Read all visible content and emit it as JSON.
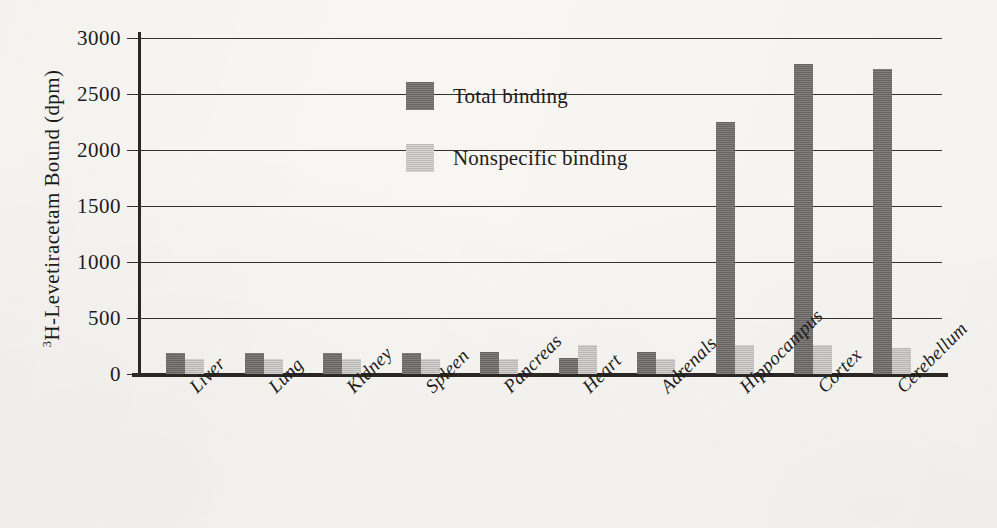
{
  "chart_data": {
    "type": "bar",
    "title": "",
    "xlabel": "",
    "ylabel": "3H-Levetiracetam Bound (dpm)",
    "ylabel_prefix_superscript": "3",
    "ylabel_rest": "H-Levetiracetam Bound (dpm)",
    "ylim": [
      0,
      3000
    ],
    "ytick_values": [
      3000,
      2500,
      2000,
      1500,
      1000,
      500,
      0
    ],
    "ytick_labels": [
      "3000",
      "2500",
      "2000",
      "1500",
      "1000",
      "500",
      "0"
    ],
    "grid": true,
    "grid_axis": "y",
    "legend_position": "upper-left-inside",
    "categories": [
      "Liver",
      "Lung",
      "Kidney",
      "Spleen",
      "Pancreas",
      "Heart",
      "Adrenals",
      "Hippocampus",
      "Cortex",
      "Cerebellum"
    ],
    "series": [
      {
        "name": "Total binding",
        "color": "#72706e",
        "values": [
          190,
          190,
          190,
          190,
          195,
          140,
          195,
          2250,
          2770,
          2720
        ]
      },
      {
        "name": "Nonspecific binding",
        "color": "#c6c5c3",
        "values": [
          130,
          130,
          130,
          130,
          135,
          255,
          135,
          255,
          255,
          230
        ]
      }
    ]
  },
  "legend": {
    "items": [
      {
        "label": "Total binding",
        "swatch": "total"
      },
      {
        "label": "Nonspecific binding",
        "swatch": "nonspecific"
      }
    ]
  }
}
